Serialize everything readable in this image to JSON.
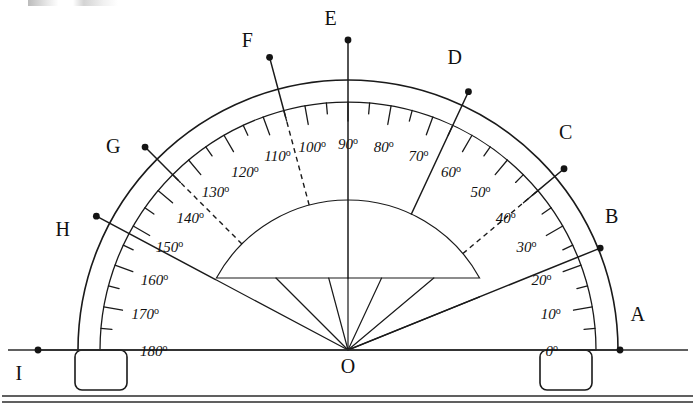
{
  "figure": {
    "origin_label": "O",
    "stroke_color": "#1a1a1a",
    "background_color": "#ffffff"
  },
  "geometry": {
    "center_x": 348,
    "center_y": 350,
    "outer_radius": 270,
    "scale_radius": 248,
    "inner_dome_radius": 150,
    "inner_dome_flat_y": 278,
    "baseline_y": 350,
    "baseline_x_start": 8,
    "baseline_x_end": 688,
    "desk_line_y": 396
  },
  "scale": {
    "major_step": 10,
    "minor_step": 5,
    "range_start": 0,
    "range_end": 180,
    "labels": [
      {
        "value": 0,
        "text": "0",
        "suffix": "o"
      },
      {
        "value": 10,
        "text": "10",
        "suffix": "o"
      },
      {
        "value": 20,
        "text": "20",
        "suffix": "o"
      },
      {
        "value": 30,
        "text": "30",
        "suffix": "o"
      },
      {
        "value": 40,
        "text": "40",
        "suffix": "o"
      },
      {
        "value": 50,
        "text": "50",
        "suffix": "o"
      },
      {
        "value": 60,
        "text": "60",
        "suffix": "o"
      },
      {
        "value": 70,
        "text": "70",
        "suffix": "o"
      },
      {
        "value": 80,
        "text": "80",
        "suffix": "o"
      },
      {
        "value": 90,
        "text": "90",
        "suffix": "o"
      },
      {
        "value": 100,
        "text": "100",
        "suffix": "o"
      },
      {
        "value": 110,
        "text": "110",
        "suffix": "o"
      },
      {
        "value": 120,
        "text": "120",
        "suffix": "o"
      },
      {
        "value": 130,
        "text": "130",
        "suffix": "o"
      },
      {
        "value": 140,
        "text": "140",
        "suffix": "o"
      },
      {
        "value": 150,
        "text": "150",
        "suffix": "o"
      },
      {
        "value": 160,
        "text": "160",
        "suffix": "o"
      },
      {
        "value": 170,
        "text": "170",
        "suffix": "o"
      },
      {
        "value": 180,
        "text": "180",
        "suffix": "o"
      }
    ]
  },
  "rays": [
    {
      "id": "A",
      "label": "A",
      "angle": 0,
      "dot_radius": 272,
      "label_radius": 292,
      "label_angle": 7,
      "dashed": false,
      "from_center": true,
      "inner_start_radius": 0
    },
    {
      "id": "B",
      "label": "B",
      "angle": 22,
      "dot_radius": 272,
      "label_radius": 296,
      "label_angle": 27,
      "dashed": false,
      "from_center": true,
      "inner_start_radius": 0
    },
    {
      "id": "C",
      "label": "C",
      "angle": 40,
      "dot_radius": 282,
      "label_radius": 308,
      "label_angle": 45,
      "dashed": true,
      "from_center": false,
      "inner_start_radius": 150
    },
    {
      "id": "D",
      "label": "D",
      "angle": 65,
      "dot_radius": 285,
      "label_radius": 312,
      "label_angle": 70,
      "dashed": false,
      "from_center": false,
      "inner_start_radius": 150
    },
    {
      "id": "E",
      "label": "E",
      "angle": 90,
      "dot_radius": 310,
      "label_radius": 332,
      "label_angle": 93,
      "dashed": false,
      "from_center": false,
      "inner_start_radius": 72
    },
    {
      "id": "F",
      "label": "F",
      "angle": 105,
      "dot_radius": 303,
      "label_radius": 326,
      "label_angle": 108,
      "dashed": true,
      "from_center": false,
      "inner_start_radius": 150
    },
    {
      "id": "G",
      "label": "G",
      "angle": 135,
      "dot_radius": 287,
      "label_radius": 311,
      "label_angle": 139,
      "dashed": true,
      "from_center": false,
      "inner_start_radius": 150
    },
    {
      "id": "H",
      "label": "H",
      "angle": 152,
      "dot_radius": 285,
      "label_radius": 310,
      "label_angle": 157,
      "dashed": false,
      "from_center": false,
      "inner_start_radius": 150
    },
    {
      "id": "I",
      "label": "I",
      "angle": 180,
      "dot_radius": 310,
      "label_radius": 330,
      "label_angle": 184,
      "dashed": false,
      "from_center": true,
      "inner_start_radius": 0
    }
  ],
  "center_rays": [
    {
      "angle": 22
    },
    {
      "angle": 40
    },
    {
      "angle": 65
    },
    {
      "angle": 90
    },
    {
      "angle": 105
    },
    {
      "angle": 135
    },
    {
      "angle": 152
    }
  ],
  "feet": [
    {
      "id": "left-foot",
      "x": 75,
      "y": 350,
      "width": 52,
      "height": 40,
      "corner_radius": 7
    },
    {
      "id": "right-foot",
      "x": 540,
      "y": 350,
      "width": 52,
      "height": 40,
      "corner_radius": 7
    }
  ]
}
